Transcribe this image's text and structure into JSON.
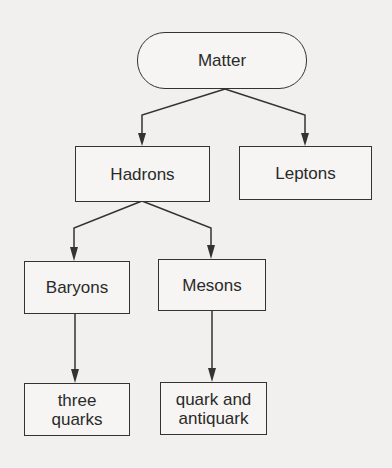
{
  "diagram": {
    "nodes": {
      "matter": "Matter",
      "hadrons": "Hadrons",
      "leptons": "Leptons",
      "baryons": "Baryons",
      "mesons": "Mesons",
      "three_quarks": "three quarks",
      "quark_antiquark": "quark and antiquark"
    },
    "edges": [
      {
        "from": "Matter",
        "to": "Hadrons"
      },
      {
        "from": "Matter",
        "to": "Leptons"
      },
      {
        "from": "Hadrons",
        "to": "Baryons"
      },
      {
        "from": "Hadrons",
        "to": "Mesons"
      },
      {
        "from": "Baryons",
        "to": "three quarks"
      },
      {
        "from": "Mesons",
        "to": "quark and antiquark"
      }
    ],
    "colors": {
      "stroke": "#333333",
      "background": "#f1f0ee"
    }
  }
}
